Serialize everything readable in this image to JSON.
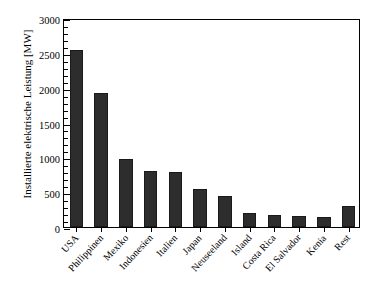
{
  "chart_data": {
    "type": "bar",
    "title": "",
    "subtitle": "",
    "xlabel": "",
    "ylabel": "Installierte elektrische Leistung [MW]",
    "ylim": [
      0,
      3000
    ],
    "ytick_values": [
      0,
      500,
      1000,
      1500,
      2000,
      2500,
      3000
    ],
    "ytick_labels": [
      "0",
      "500",
      "1000",
      "1500",
      "2000",
      "2500",
      "3000"
    ],
    "yminor_step": 100,
    "grid": false,
    "legend": null,
    "categories": [
      "USA",
      "Philippinen",
      "Mexiko",
      "Indonesien",
      "Italien",
      "Japan",
      "Neuseeland",
      "Island",
      "Costa Rica",
      "El Salvador",
      "Kenia",
      "Rest"
    ],
    "values": [
      2540,
      1930,
      970,
      800,
      790,
      540,
      440,
      200,
      175,
      165,
      150,
      300
    ],
    "series": [
      {
        "name": "Installierte elektrische Leistung",
        "values": [
          2540,
          1930,
          970,
          800,
          790,
          540,
          440,
          200,
          175,
          165,
          150,
          300
        ]
      }
    ],
    "bar_color": "#2d2d2d",
    "axis_color": "#000000",
    "background_color": "#ffffff"
  }
}
